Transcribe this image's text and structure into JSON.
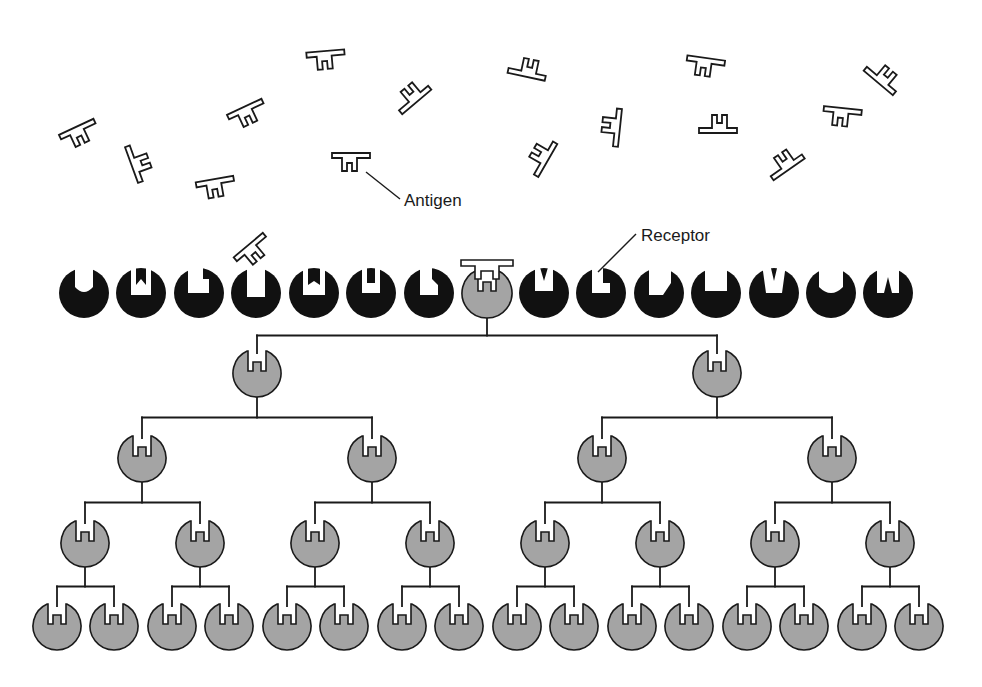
{
  "diagram": {
    "labels": {
      "antigen": "Antigen",
      "receptor": "Receptor"
    },
    "colors": {
      "background": "#ffffff",
      "stroke": "#1a1a1a",
      "resting_cell": "#111111",
      "selected_cell": "#a4a4a4"
    },
    "free_antigens": [
      {
        "x": 80,
        "y": 135,
        "rot": -25
      },
      {
        "x": 140,
        "y": 162,
        "rot": -110
      },
      {
        "x": 248,
        "y": 115,
        "rot": -25
      },
      {
        "x": 326,
        "y": 60,
        "rot": -5
      },
      {
        "x": 411,
        "y": 95,
        "rot": 140
      },
      {
        "x": 216,
        "y": 188,
        "rot": -10
      },
      {
        "x": 351,
        "y": 162,
        "rot": 0
      },
      {
        "x": 254,
        "y": 252,
        "rot": -40
      },
      {
        "x": 528,
        "y": 68,
        "rot": 192
      },
      {
        "x": 540,
        "y": 156,
        "rot": 120
      },
      {
        "x": 611,
        "y": 127,
        "rot": 96
      },
      {
        "x": 705,
        "y": 67,
        "rot": 8
      },
      {
        "x": 718,
        "y": 124,
        "rot": 180
      },
      {
        "x": 784,
        "y": 162,
        "rot": 145
      },
      {
        "x": 842,
        "y": 117,
        "rot": 6
      },
      {
        "x": 884,
        "y": 76,
        "rot": -140
      }
    ],
    "receptor_row": {
      "y": 293,
      "radius": 25,
      "cells": [
        {
          "x": 84,
          "notch": "u"
        },
        {
          "x": 141,
          "notch": "w"
        },
        {
          "x": 199,
          "notch": "step"
        },
        {
          "x": 256,
          "notch": "deep"
        },
        {
          "x": 314,
          "notch": "w2"
        },
        {
          "x": 371,
          "notch": "m"
        },
        {
          "x": 429,
          "notch": "n"
        },
        {
          "x": 487,
          "notch": "match",
          "selected": true
        },
        {
          "x": 544,
          "notch": "m2"
        },
        {
          "x": 601,
          "notch": "step2"
        },
        {
          "x": 659,
          "notch": "slope"
        },
        {
          "x": 716,
          "notch": "box"
        },
        {
          "x": 774,
          "notch": "v"
        },
        {
          "x": 831,
          "notch": "round"
        },
        {
          "x": 888,
          "notch": "spike"
        }
      ]
    },
    "clone_tree": {
      "root_x": 487,
      "levels": [
        {
          "y": 373,
          "xs": [
            257,
            717
          ]
        },
        {
          "y": 458,
          "xs": [
            142,
            372,
            602,
            832
          ]
        },
        {
          "y": 543,
          "xs": [
            85,
            200,
            315,
            430,
            545,
            660,
            775,
            890
          ]
        },
        {
          "y": 626,
          "xs": [
            57,
            114,
            172,
            229,
            287,
            344,
            402,
            459,
            517,
            574,
            632,
            689,
            747,
            804,
            862,
            919
          ]
        }
      ],
      "cell_radius": 24
    }
  }
}
